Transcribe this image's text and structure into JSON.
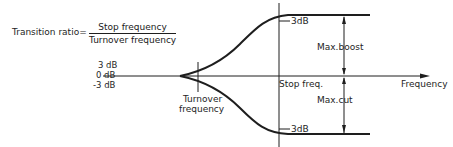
{
  "formula": {
    "label": "Transition ratio=",
    "numerator": "Stop frequency",
    "denominator": "Turnover frequency"
  },
  "axis": {
    "y_labels": [
      "3 dB",
      "0 dB",
      "-3 dB"
    ],
    "x_label": "Frequency"
  },
  "markers": {
    "turnover": [
      "Turnover",
      "frequency"
    ],
    "stop": "Stop freq.",
    "top_db": "3dB",
    "bottom_db": "3dB",
    "max_boost": "Max.boost",
    "max_cut": "Max.cut"
  },
  "colors": {
    "line": "#1e1e1e",
    "background": "#ffffff"
  }
}
